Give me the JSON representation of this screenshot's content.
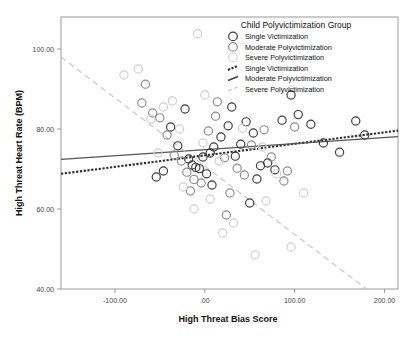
{
  "chart_data": {
    "type": "scatter",
    "title": "",
    "xlabel": "High Threat Bias Score",
    "ylabel": "High Threat Heart Rate (BPM)",
    "xlim": [
      -160,
      215
    ],
    "ylim": [
      40,
      108
    ],
    "xticks": [
      "-100.00",
      ".00",
      "100.00",
      "200.00"
    ],
    "xtickvals": [
      -100,
      0,
      100,
      200
    ],
    "yticks": [
      "40.00",
      "60.00",
      "80.00",
      "100.00"
    ],
    "ytickvals": [
      40,
      60,
      80,
      100
    ],
    "grid": false,
    "legend_position": "top-right",
    "legend_title": "Child Polyvictimization Group",
    "series": [
      {
        "name": "Single Victimization",
        "marker": "open-circle",
        "color": "#3a3a3a",
        "points": [
          [
            -38,
            80.5
          ],
          [
            -30,
            75.8
          ],
          [
            -22,
            85.0
          ],
          [
            -18,
            72.5
          ],
          [
            -14,
            71.0
          ],
          [
            -10,
            70.4
          ],
          [
            -6,
            70.1
          ],
          [
            -2,
            73.0
          ],
          [
            6,
            74.0
          ],
          [
            10,
            75.5
          ],
          [
            18,
            78.0
          ],
          [
            26,
            80.8
          ],
          [
            34,
            73.2
          ],
          [
            40,
            76.2
          ],
          [
            46,
            81.8
          ],
          [
            54,
            79.0
          ],
          [
            62,
            70.8
          ],
          [
            70,
            71.5
          ],
          [
            78,
            69.8
          ],
          [
            86,
            82.2
          ],
          [
            96,
            88.5
          ],
          [
            104,
            83.6
          ],
          [
            118,
            81.2
          ],
          [
            132,
            76.5
          ],
          [
            150,
            74.2
          ],
          [
            168,
            82.0
          ],
          [
            178,
            78.5
          ],
          [
            -46,
            69.5
          ],
          [
            -54,
            68.0
          ],
          [
            2,
            68.8
          ],
          [
            30,
            85.5
          ],
          [
            58,
            67.5
          ],
          [
            8,
            66.0
          ],
          [
            50,
            61.5
          ]
        ]
      },
      {
        "name": "Moderate Polyvictimization",
        "marker": "open-circle",
        "color": "#8c8c8c",
        "points": [
          [
            -66,
            91.2
          ],
          [
            -58,
            84.0
          ],
          [
            -50,
            82.8
          ],
          [
            -42,
            78.5
          ],
          [
            -34,
            73.5
          ],
          [
            -26,
            72.0
          ],
          [
            -20,
            69.2
          ],
          [
            -12,
            67.4
          ],
          [
            -4,
            66.5
          ],
          [
            4,
            79.5
          ],
          [
            12,
            83.2
          ],
          [
            22,
            72.8
          ],
          [
            36,
            70.2
          ],
          [
            44,
            68.5
          ],
          [
            52,
            76.0
          ],
          [
            66,
            79.8
          ],
          [
            74,
            73.0
          ],
          [
            88,
            67.0
          ],
          [
            100,
            80.5
          ],
          [
            -70,
            86.5
          ],
          [
            14,
            86.8
          ],
          [
            -16,
            64.5
          ],
          [
            28,
            64.0
          ],
          [
            24,
            58.5
          ],
          [
            92,
            69.5
          ]
        ]
      },
      {
        "name": "Severe Polyvictimization",
        "marker": "open-circle",
        "color": "#cfcfcf",
        "points": [
          [
            -90,
            93.5
          ],
          [
            -74,
            95.0
          ],
          [
            -60,
            82.5
          ],
          [
            -46,
            85.5
          ],
          [
            -36,
            87.0
          ],
          [
            -28,
            80.0
          ],
          [
            -8,
            103.8
          ],
          [
            0,
            88.5
          ],
          [
            -2,
            76.5
          ],
          [
            16,
            72.0
          ],
          [
            42,
            80.2
          ],
          [
            64,
            75.5
          ],
          [
            80,
            68.8
          ],
          [
            -52,
            74.0
          ],
          [
            -24,
            65.5
          ],
          [
            6,
            62.5
          ],
          [
            32,
            56.5
          ],
          [
            20,
            54.0
          ],
          [
            56,
            48.5
          ],
          [
            96,
            50.5
          ],
          [
            110,
            64.0
          ],
          [
            -12,
            60.0
          ],
          [
            68,
            62.0
          ]
        ]
      }
    ],
    "fit_lines": [
      {
        "name": "Single Victimization",
        "style": "dotted",
        "color": "#2b2b2b",
        "x0": -160,
        "y0": 68.8,
        "x1": 215,
        "y1": 79.6
      },
      {
        "name": "Moderate Polyvictimization",
        "style": "solid",
        "color": "#555555",
        "x0": -160,
        "y0": 72.4,
        "x1": 215,
        "y1": 78.1
      },
      {
        "name": "Severe Polyvictimization",
        "style": "dashed",
        "color": "#c8c8c8",
        "x0": -160,
        "y0": 98.0,
        "x1": 180,
        "y1": 40.0
      }
    ]
  },
  "legend": {
    "title": "Child Polyvictimization Group",
    "marker_entries": [
      {
        "label": "Single Victimization",
        "color": "#3a3a3a"
      },
      {
        "label": "Moderate Polyvictimization",
        "color": "#8c8c8c"
      },
      {
        "label": "Severe Polyvictimization",
        "color": "#d4d4d4"
      }
    ],
    "line_entries": [
      {
        "label": "Single Victimization",
        "style": "dotted",
        "color": "#2b2b2b"
      },
      {
        "label": "Moderate Polyvictimization",
        "style": "solid",
        "color": "#444444"
      },
      {
        "label": "Severe Polyvictimization",
        "style": "dashed",
        "color": "#c8c8c8"
      }
    ]
  }
}
